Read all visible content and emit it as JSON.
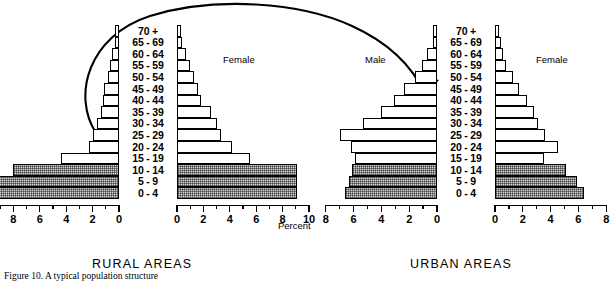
{
  "figure": {
    "caption": "Figure 10.  A typical population structure",
    "percent_label": "Percent",
    "migration_arrow": "migration-arrow"
  },
  "charts": [
    {
      "id": "rural",
      "title": "RURAL     AREAS",
      "male_label": "",
      "female_label": "Female",
      "axis_max": 10,
      "ticks": [
        10,
        8,
        6,
        4,
        2,
        0
      ],
      "ticks_right": [
        0,
        2,
        4,
        6,
        8,
        10
      ]
    },
    {
      "id": "urban",
      "title": "URBAN     AREAS",
      "male_label": "Male",
      "female_label": "Female",
      "axis_max": 8,
      "ticks": [
        8,
        6,
        4,
        2,
        0
      ],
      "ticks_right": [
        0,
        2,
        4,
        6,
        8
      ]
    }
  ],
  "age_groups": [
    "70 +",
    "65 - 69",
    "60 - 64",
    "55 - 59",
    "50 - 54",
    "45 - 49",
    "40 - 44",
    "35 - 39",
    "30 - 34",
    "25 - 29",
    "20 - 24",
    "15 - 19",
    "10 - 14",
    "5 - 9",
    "0 - 4"
  ],
  "chart_data": {
    "type": "bar",
    "subtype": "population-pyramid",
    "title": "A typical population structure",
    "xlabel": "Percent",
    "ylabel": "Age group",
    "categories": [
      "70 +",
      "65 - 69",
      "60 - 64",
      "55 - 59",
      "50 - 54",
      "45 - 49",
      "40 - 44",
      "35 - 39",
      "30 - 34",
      "25 - 29",
      "20 - 24",
      "15 - 19",
      "10 - 14",
      "5 - 9",
      "0 - 4"
    ],
    "panels": [
      {
        "name": "RURAL     AREAS",
        "xlim": [
          0,
          10
        ],
        "xticks": [
          0,
          2,
          4,
          6,
          8,
          10
        ],
        "shaded_categories": [
          "10 - 14",
          "5 - 9",
          "0 - 4"
        ],
        "series": [
          {
            "name": "Male",
            "side": "left",
            "values": [
              0.3,
              0.3,
              0.5,
              0.7,
              0.8,
              1.1,
              1.2,
              1.4,
              1.7,
              2.0,
              2.3,
              4.4,
              8.0,
              9.3,
              9.3
            ]
          },
          {
            "name": "Female",
            "side": "right",
            "values": [
              0.3,
              0.4,
              0.7,
              1.0,
              1.3,
              1.6,
              1.8,
              2.6,
              3.0,
              3.3,
              4.2,
              5.5,
              9.1,
              9.1,
              9.1
            ]
          }
        ]
      },
      {
        "name": "URBAN     AREAS",
        "xlim": [
          0,
          8
        ],
        "xticks": [
          0,
          2,
          4,
          6,
          8
        ],
        "shaded_categories": [
          "10 - 14",
          "5 - 9",
          "0 - 4"
        ],
        "series": [
          {
            "name": "Male",
            "side": "left",
            "values": [
              0.3,
              0.3,
              0.7,
              1.1,
              1.6,
              2.4,
              3.1,
              4.0,
              5.3,
              7.0,
              6.2,
              5.9,
              6.1,
              6.3,
              6.6
            ]
          },
          {
            "name": "Female",
            "side": "right",
            "values": [
              0.3,
              0.4,
              0.6,
              0.8,
              1.3,
              1.7,
              2.3,
              2.8,
              3.1,
              3.6,
              4.5,
              3.5,
              5.1,
              5.9,
              6.4
            ]
          }
        ]
      }
    ],
    "grid": false,
    "legend": "in-plot text labels: Male (left), Female (right)"
  }
}
